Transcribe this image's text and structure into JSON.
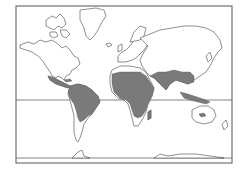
{
  "map": {
    "type": "world-distribution-map",
    "projection": "cylindrical",
    "frame": {
      "x": 16,
      "y": 6,
      "width": 216,
      "height": 157
    },
    "reference_lines": [
      {
        "name": "equator",
        "y": 100
      },
      {
        "name": "southern-limit",
        "y": 158
      }
    ],
    "colors": {
      "background": "#ffffff",
      "land_outline": "#444444",
      "frame": "#555555",
      "shaded_region": "#7a7a7a",
      "unshaded_land": "#ffffff"
    },
    "shaded_regions": [
      "Central America & Mexico",
      "Caribbean",
      "Northern/Central South America",
      "Africa (except north coast & southern tip)",
      "Arabian Peninsula south",
      "South Asia / India",
      "Southeast Asia",
      "Indonesia / New Guinea",
      "Madagascar",
      "Central Australia (small patch)"
    ]
  }
}
